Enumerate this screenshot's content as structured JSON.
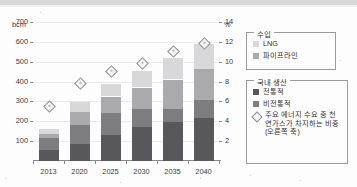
{
  "chart_data": {
    "type": "bar",
    "title": "",
    "subtitle": "",
    "xlabel": "",
    "ylabel": "bcm",
    "y2label": "%",
    "ylim": [
      0,
      700
    ],
    "y2lim": [
      0,
      14
    ],
    "grid": true,
    "stacked": true,
    "legend_position": "right",
    "categories": [
      "2013",
      "2020",
      "2025",
      "2030",
      "2035",
      "2040"
    ],
    "yticks": [
      "100",
      "200",
      "300",
      "400",
      "500",
      "600",
      "700"
    ],
    "y2ticks": [
      "2",
      "4",
      "6",
      "8",
      "10",
      "12",
      "14"
    ],
    "series": [
      {
        "name": "전통적",
        "key": "conventional",
        "color": "#58585a",
        "values": [
          55,
          85,
          130,
          170,
          195,
          215
        ]
      },
      {
        "name": "비전통적",
        "key": "unconventional",
        "color": "#7d7d80",
        "values": [
          60,
          95,
          110,
          90,
          65,
          90
        ]
      },
      {
        "name": "파이프라인",
        "key": "pipeline",
        "color": "#aaaaac",
        "values": [
          20,
          65,
          85,
          110,
          150,
          160
        ]
      },
      {
        "name": "LNG",
        "key": "lng",
        "color": "#d8d8da",
        "values": [
          25,
          50,
          65,
          85,
          110,
          125
        ]
      }
    ],
    "marker_series": {
      "name": "주요 에너지 수요 중 천연가스가 차지하는 비중(오른쪽 축)",
      "axis": "right",
      "marker": "diamond",
      "values": [
        5.6,
        7.9,
        9.1,
        9.9,
        11.1,
        11.9
      ]
    }
  },
  "axes": {
    "left_unit": "bcm",
    "right_unit": "%"
  },
  "legends": [
    {
      "title": "수입",
      "items": [
        {
          "label": "LNG",
          "swatch": "lng-swatch",
          "color": "#d8d8da"
        },
        {
          "label": "파이프라인",
          "swatch": "pipeline-swatch",
          "color": "#aaaaac"
        }
      ]
    },
    {
      "title": "국내 생산",
      "items": [
        {
          "label": "전통적",
          "swatch": "conventional-swatch",
          "color": "#58585a"
        },
        {
          "label": "비전통적",
          "swatch": "unconventional-swatch",
          "color": "#7d7d80"
        },
        {
          "label": "주요 에너지 수요 중 천연가스가 차지하는 비중(오른쪽 축)",
          "swatch": "diamond-marker-icon",
          "color": "#f4f4f4"
        }
      ]
    }
  ]
}
